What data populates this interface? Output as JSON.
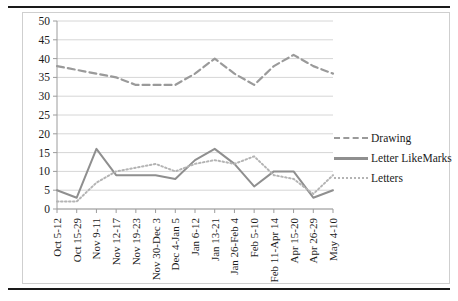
{
  "figure": {
    "has_top_rule": true,
    "has_bottom_rule": true,
    "border_color": "#cfcfcf",
    "background": "#ffffff"
  },
  "legend": {
    "position": "right",
    "entries": [
      {
        "label": "Drawing",
        "style": "dashed",
        "color": "#9a9a9a"
      },
      {
        "label": "Letter LikeMarks",
        "style": "solid",
        "color": "#8f8f8f"
      },
      {
        "label": "Letters",
        "style": "dotted",
        "color": "#b4b4b4"
      }
    ]
  },
  "chart_data": {
    "type": "line",
    "title": "",
    "xlabel": "",
    "ylabel": "",
    "ylim": [
      0,
      50
    ],
    "yticks": [
      0,
      5,
      10,
      15,
      20,
      25,
      30,
      35,
      40,
      45,
      50
    ],
    "grid": true,
    "grid_color": "#d6d6d6",
    "legend_position": "right",
    "categories": [
      "Oct 5-12",
      "Oct 15-29",
      "Nov 9-11",
      "Nov 12-17",
      "Nov 19-23",
      "Nov 30-Dec 3",
      "Dec 4-Jan 5",
      "Jan 6-12",
      "Jan 13-21",
      "Jan 26-Feb 4",
      "Feb 5-10",
      "Feb 11-Apr 14",
      "Apr 15-20",
      "Apr 26-29",
      "May 4-10"
    ],
    "series": [
      {
        "name": "Drawing",
        "style": "dashed",
        "color": "#9a9a9a",
        "values": [
          38,
          37,
          36,
          35,
          33,
          33,
          33,
          36,
          40,
          36,
          33,
          38,
          41,
          38,
          36
        ]
      },
      {
        "name": "Letter LikeMarks",
        "style": "solid",
        "color": "#8f8f8f",
        "values": [
          5,
          3,
          16,
          9,
          9,
          9,
          8,
          13,
          16,
          12,
          6,
          10,
          10,
          3,
          5
        ]
      },
      {
        "name": "Letters",
        "style": "dotted",
        "color": "#b4b4b4",
        "values": [
          2,
          2,
          7,
          10,
          11,
          12,
          10,
          12,
          13,
          12,
          14,
          9,
          8,
          4,
          9
        ]
      }
    ]
  }
}
